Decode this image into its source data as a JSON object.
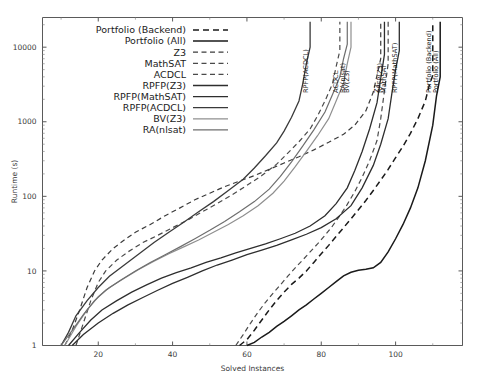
{
  "chart_data": {
    "type": "line",
    "title": "",
    "xlabel": "Solved Instances",
    "ylabel": "Runtime (s)",
    "yscale": "log",
    "xlim": [
      5,
      118
    ],
    "ylim": [
      1,
      25000
    ],
    "xticks": [
      20,
      40,
      60,
      80,
      100
    ],
    "yticks": [
      1,
      10,
      100,
      1000,
      10000
    ],
    "grid": false,
    "legend_position": "top-left-inside",
    "series": [
      {
        "name": "Portfolio (Backend)",
        "style": "dashed",
        "color": "#1a1a1a",
        "width": 1.5,
        "vline_at": 110,
        "points": [
          [
            58,
            1.0
          ],
          [
            60,
            1.2
          ],
          [
            62,
            1.6
          ],
          [
            64,
            2.2
          ],
          [
            66,
            3.0
          ],
          [
            68,
            4.0
          ],
          [
            70,
            5.2
          ],
          [
            72,
            6.6
          ],
          [
            74,
            8.0
          ],
          [
            76,
            10.0
          ],
          [
            78,
            13.0
          ],
          [
            80,
            17.0
          ],
          [
            82,
            22.0
          ],
          [
            84,
            29.0
          ],
          [
            86,
            38.0
          ],
          [
            88,
            50.0
          ],
          [
            90,
            66.0
          ],
          [
            92,
            88.0
          ],
          [
            94,
            120.0
          ],
          [
            96,
            165.0
          ],
          [
            98,
            230.0
          ],
          [
            100,
            330.0
          ],
          [
            102,
            470.0
          ],
          [
            104,
            700.0
          ],
          [
            106,
            1100.0
          ],
          [
            108,
            1900.0
          ],
          [
            109,
            3000.0
          ],
          [
            110,
            4200.0
          ],
          [
            110,
            22000.0
          ]
        ]
      },
      {
        "name": "Portfolio (All)",
        "style": "solid",
        "color": "#1a1a1a",
        "width": 1.5,
        "vline_at": 112,
        "points": [
          [
            60,
            1.0
          ],
          [
            62,
            1.1
          ],
          [
            64,
            1.3
          ],
          [
            66,
            1.5
          ],
          [
            68,
            1.8
          ],
          [
            70,
            2.1
          ],
          [
            72,
            2.5
          ],
          [
            74,
            3.0
          ],
          [
            76,
            3.5
          ],
          [
            78,
            4.2
          ],
          [
            80,
            5.0
          ],
          [
            82,
            6.0
          ],
          [
            84,
            7.2
          ],
          [
            86,
            8.6
          ],
          [
            88,
            9.6
          ],
          [
            90,
            10.2
          ],
          [
            92,
            10.5
          ],
          [
            94,
            11.0
          ],
          [
            96,
            13.0
          ],
          [
            98,
            18.0
          ],
          [
            100,
            27.0
          ],
          [
            102,
            42.0
          ],
          [
            104,
            70.0
          ],
          [
            106,
            130.0
          ],
          [
            108,
            300.0
          ],
          [
            110,
            900.0
          ],
          [
            111,
            2200.0
          ],
          [
            112,
            4000.0
          ],
          [
            112,
            22000.0
          ]
        ]
      },
      {
        "name": "Z3",
        "style": "dashed",
        "color": "#3c3c3c",
        "width": 1.2,
        "vline_at": 96,
        "points": [
          [
            11,
            1.0
          ],
          [
            13,
            1.6
          ],
          [
            15,
            3.0
          ],
          [
            17,
            6.0
          ],
          [
            19,
            10.0
          ],
          [
            21,
            14.0
          ],
          [
            24,
            20.0
          ],
          [
            27,
            26.0
          ],
          [
            30,
            33.0
          ],
          [
            34,
            42.0
          ],
          [
            38,
            55.0
          ],
          [
            42,
            70.0
          ],
          [
            46,
            90.0
          ],
          [
            50,
            110.0
          ],
          [
            54,
            135.0
          ],
          [
            58,
            160.0
          ],
          [
            62,
            190.0
          ],
          [
            66,
            230.0
          ],
          [
            70,
            280.0
          ],
          [
            74,
            340.0
          ],
          [
            78,
            420.0
          ],
          [
            82,
            530.0
          ],
          [
            86,
            680.0
          ],
          [
            89,
            900.0
          ],
          [
            92,
            1400.0
          ],
          [
            94,
            2500.0
          ],
          [
            95,
            4200.0
          ],
          [
            96,
            7000.0
          ],
          [
            96,
            22000.0
          ]
        ]
      },
      {
        "name": "MathSAT",
        "style": "dashed",
        "color": "#4a4a4a",
        "width": 1.2,
        "vline_at": 98,
        "points": [
          [
            57,
            1.0
          ],
          [
            59,
            1.4
          ],
          [
            61,
            2.0
          ],
          [
            63,
            2.8
          ],
          [
            65,
            3.8
          ],
          [
            67,
            5.0
          ],
          [
            69,
            6.5
          ],
          [
            71,
            8.5
          ],
          [
            73,
            11.0
          ],
          [
            75,
            14.0
          ],
          [
            77,
            18.0
          ],
          [
            79,
            23.0
          ],
          [
            81,
            30.0
          ],
          [
            83,
            40.0
          ],
          [
            85,
            55.0
          ],
          [
            87,
            78.0
          ],
          [
            89,
            115.0
          ],
          [
            91,
            180.0
          ],
          [
            93,
            300.0
          ],
          [
            95,
            560.0
          ],
          [
            96,
            1100.0
          ],
          [
            97,
            2600.0
          ],
          [
            98,
            6000.0
          ],
          [
            98,
            22000.0
          ]
        ]
      },
      {
        "name": "ACDCL",
        "style": "dashed",
        "color": "#4a4a4a",
        "width": 1.2,
        "vline_at": 85,
        "points": [
          [
            14,
            1.0
          ],
          [
            16,
            2.0
          ],
          [
            18,
            4.0
          ],
          [
            20,
            7.0
          ],
          [
            22,
            10.0
          ],
          [
            25,
            14.0
          ],
          [
            28,
            18.0
          ],
          [
            32,
            24.0
          ],
          [
            36,
            30.0
          ],
          [
            40,
            38.0
          ],
          [
            44,
            48.0
          ],
          [
            48,
            62.0
          ],
          [
            52,
            80.0
          ],
          [
            56,
            105.0
          ],
          [
            60,
            140.0
          ],
          [
            64,
            190.0
          ],
          [
            68,
            270.0
          ],
          [
            71,
            380.0
          ],
          [
            74,
            540.0
          ],
          [
            77,
            800.0
          ],
          [
            79,
            1200.0
          ],
          [
            81,
            1900.0
          ],
          [
            83,
            3200.0
          ],
          [
            84,
            5500.0
          ],
          [
            85,
            9000.0
          ],
          [
            85,
            22000.0
          ]
        ]
      },
      {
        "name": "RPFP(Z3)",
        "style": "solid",
        "color": "#2e2e2e",
        "width": 1.3,
        "vline_at": 97,
        "points": [
          [
            12,
            1.0
          ],
          [
            15,
            1.5
          ],
          [
            18,
            2.2
          ],
          [
            21,
            3.0
          ],
          [
            25,
            4.0
          ],
          [
            29,
            5.2
          ],
          [
            33,
            6.5
          ],
          [
            37,
            8.0
          ],
          [
            41,
            9.5
          ],
          [
            45,
            11.0
          ],
          [
            49,
            13.0
          ],
          [
            53,
            15.0
          ],
          [
            57,
            17.5
          ],
          [
            61,
            20.0
          ],
          [
            65,
            23.0
          ],
          [
            69,
            27.0
          ],
          [
            73,
            32.0
          ],
          [
            77,
            40.0
          ],
          [
            81,
            55.0
          ],
          [
            84,
            80.0
          ],
          [
            87,
            130.0
          ],
          [
            89,
            220.0
          ],
          [
            91,
            400.0
          ],
          [
            93,
            800.0
          ],
          [
            95,
            1800.0
          ],
          [
            96,
            3800.0
          ],
          [
            97,
            8000.0
          ],
          [
            97,
            22000.0
          ]
        ]
      },
      {
        "name": "RPFP(MathSAT)",
        "style": "solid",
        "color": "#2e2e2e",
        "width": 1.3,
        "vline_at": 101,
        "points": [
          [
            13,
            1.0
          ],
          [
            16,
            1.4
          ],
          [
            20,
            2.0
          ],
          [
            24,
            2.7
          ],
          [
            28,
            3.5
          ],
          [
            32,
            4.4
          ],
          [
            36,
            5.5
          ],
          [
            40,
            6.8
          ],
          [
            44,
            8.2
          ],
          [
            48,
            10.0
          ],
          [
            52,
            12.0
          ],
          [
            56,
            14.0
          ],
          [
            60,
            16.5
          ],
          [
            64,
            19.0
          ],
          [
            68,
            22.0
          ],
          [
            72,
            26.0
          ],
          [
            76,
            31.0
          ],
          [
            80,
            38.0
          ],
          [
            84,
            50.0
          ],
          [
            88,
            75.0
          ],
          [
            91,
            130.0
          ],
          [
            94,
            260.0
          ],
          [
            96,
            500.0
          ],
          [
            98,
            1100.0
          ],
          [
            99,
            2400.0
          ],
          [
            100,
            5000.0
          ],
          [
            101,
            9000.0
          ],
          [
            101,
            22000.0
          ]
        ]
      },
      {
        "name": "RPFP(ACDCL)",
        "style": "solid",
        "color": "#3a3a3a",
        "width": 1.3,
        "vline_at": 77,
        "points": [
          [
            10,
            1.0
          ],
          [
            12,
            1.5
          ],
          [
            14,
            2.5
          ],
          [
            17,
            4.0
          ],
          [
            20,
            6.0
          ],
          [
            23,
            8.5
          ],
          [
            27,
            12.0
          ],
          [
            31,
            17.0
          ],
          [
            35,
            24.0
          ],
          [
            39,
            33.0
          ],
          [
            43,
            45.0
          ],
          [
            47,
            62.0
          ],
          [
            51,
            85.0
          ],
          [
            55,
            120.0
          ],
          [
            59,
            170.0
          ],
          [
            62,
            240.0
          ],
          [
            65,
            350.0
          ],
          [
            68,
            520.0
          ],
          [
            70,
            750.0
          ],
          [
            72,
            1150.0
          ],
          [
            74,
            1900.0
          ],
          [
            75,
            3200.0
          ],
          [
            76,
            6000.0
          ],
          [
            77,
            10000.0
          ],
          [
            77,
            22000.0
          ]
        ]
      },
      {
        "name": "BV(Z3)",
        "style": "solid",
        "color": "#8f8f8f",
        "width": 1.2,
        "vline_at": 88,
        "points": [
          [
            11,
            1.0
          ],
          [
            14,
            1.8
          ],
          [
            17,
            3.0
          ],
          [
            20,
            4.5
          ],
          [
            23,
            6.0
          ],
          [
            27,
            8.0
          ],
          [
            31,
            10.5
          ],
          [
            35,
            13.5
          ],
          [
            39,
            17.0
          ],
          [
            43,
            21.0
          ],
          [
            47,
            26.0
          ],
          [
            51,
            33.0
          ],
          [
            55,
            42.0
          ],
          [
            59,
            55.0
          ],
          [
            63,
            75.0
          ],
          [
            67,
            110.0
          ],
          [
            70,
            160.0
          ],
          [
            73,
            250.0
          ],
          [
            76,
            400.0
          ],
          [
            79,
            650.0
          ],
          [
            82,
            1100.0
          ],
          [
            84,
            1900.0
          ],
          [
            86,
            3300.0
          ],
          [
            87,
            6000.0
          ],
          [
            88,
            10000.0
          ],
          [
            88,
            22000.0
          ]
        ]
      },
      {
        "name": "RA(nlsat)",
        "style": "solid",
        "color": "#6e6e6e",
        "width": 1.2,
        "vline_at": 87,
        "points": [
          [
            10,
            1.0
          ],
          [
            13,
            1.6
          ],
          [
            16,
            2.6
          ],
          [
            19,
            4.0
          ],
          [
            22,
            5.5
          ],
          [
            26,
            7.5
          ],
          [
            30,
            10.0
          ],
          [
            34,
            13.0
          ],
          [
            38,
            16.5
          ],
          [
            42,
            21.0
          ],
          [
            46,
            27.0
          ],
          [
            50,
            35.0
          ],
          [
            54,
            46.0
          ],
          [
            58,
            62.0
          ],
          [
            62,
            85.0
          ],
          [
            66,
            125.0
          ],
          [
            69,
            185.0
          ],
          [
            72,
            290.0
          ],
          [
            75,
            470.0
          ],
          [
            78,
            780.0
          ],
          [
            81,
            1350.0
          ],
          [
            83,
            2300.0
          ],
          [
            85,
            4000.0
          ],
          [
            86,
            7000.0
          ],
          [
            87,
            11000.0
          ],
          [
            87,
            22000.0
          ]
        ]
      }
    ],
    "annotations": [
      {
        "label": "RPFP(ACDCL)",
        "at_x": 77
      },
      {
        "label": "ACDCL",
        "at_x": 85
      },
      {
        "label": "RA(nlsat)",
        "at_x": 87
      },
      {
        "label": "BV(Z3)",
        "at_x": 88
      },
      {
        "label": "Z3",
        "at_x": 96
      },
      {
        "label": "MathSAT",
        "at_x": 98
      },
      {
        "label": "RPFP(Z3)",
        "at_x": 97
      },
      {
        "label": "RPFP(MathSAT)",
        "at_x": 101
      },
      {
        "label": "Portfolio (Backend)",
        "at_x": 110
      },
      {
        "label": "Portfolio (All)",
        "at_x": 112
      }
    ]
  },
  "legend": {
    "items": [
      {
        "label": "Portfolio (Backend)",
        "style": "dashed",
        "color": "#1a1a1a"
      },
      {
        "label": "Portfolio (All)",
        "style": "solid",
        "color": "#1a1a1a"
      },
      {
        "label": "Z3",
        "style": "dashed",
        "color": "#3c3c3c"
      },
      {
        "label": "MathSAT",
        "style": "dashed",
        "color": "#4a4a4a"
      },
      {
        "label": "ACDCL",
        "style": "dashed",
        "color": "#4a4a4a"
      },
      {
        "label": "RPFP(Z3)",
        "style": "solid",
        "color": "#2e2e2e"
      },
      {
        "label": "RPFP(MathSAT)",
        "style": "solid",
        "color": "#2e2e2e"
      },
      {
        "label": "RPFP(ACDCL)",
        "style": "solid",
        "color": "#3a3a3a"
      },
      {
        "label": "BV(Z3)",
        "style": "solid",
        "color": "#8f8f8f"
      },
      {
        "label": "RA(nlsat)",
        "style": "solid",
        "color": "#6e6e6e"
      }
    ]
  },
  "axes": {
    "x_tick_labels": [
      "20",
      "40",
      "60",
      "80",
      "100"
    ],
    "y_tick_labels": [
      "1",
      "10",
      "100",
      "1000",
      "10000"
    ],
    "xlabel": "Solved Instances",
    "ylabel": "Runtime (s)"
  }
}
